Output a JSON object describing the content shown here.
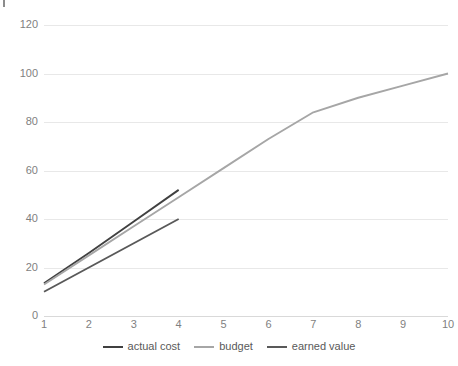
{
  "chart_data": {
    "type": "line",
    "title": "",
    "subtitle": "",
    "xlabel": "",
    "ylabel": "",
    "x": [
      1,
      2,
      3,
      4,
      5,
      6,
      7,
      8,
      9,
      10
    ],
    "xlim": [
      1,
      10
    ],
    "ylim": [
      0,
      120
    ],
    "y_ticks": [
      0,
      20,
      40,
      60,
      80,
      100,
      120
    ],
    "x_ticks": [
      1,
      2,
      3,
      4,
      5,
      6,
      7,
      8,
      9,
      10
    ],
    "x_tick_labels": [
      "1",
      "2",
      "3",
      "4",
      "5",
      "6",
      "7",
      "8",
      "9",
      "10"
    ],
    "y_tick_labels": [
      "0",
      "20",
      "40",
      "60",
      "80",
      "100",
      "120"
    ],
    "grid": true,
    "grid_axis": "y",
    "legend_position": "bottom",
    "background_color": "#ffffff",
    "gridline_color": "#e8e8e8",
    "tick_label_color": "#7f7f7f",
    "series": [
      {
        "name": "actual cost",
        "color": "#404040",
        "x": [
          1,
          2,
          3,
          4
        ],
        "values": [
          13.5,
          26,
          39,
          52
        ]
      },
      {
        "name": "budget",
        "color": "#a6a6a6",
        "x": [
          1,
          2,
          3,
          4,
          5,
          6,
          7,
          8,
          9,
          10
        ],
        "values": [
          13,
          25,
          37,
          49,
          61,
          73,
          84,
          90,
          95,
          100
        ]
      },
      {
        "name": "earned value",
        "color": "#595959",
        "x": [
          1,
          2,
          3,
          4
        ],
        "values": [
          10,
          20,
          30,
          40
        ]
      }
    ]
  },
  "legend": {
    "items": [
      {
        "label": "actual cost",
        "color": "#404040"
      },
      {
        "label": "budget",
        "color": "#a6a6a6"
      },
      {
        "label": "earned value",
        "color": "#595959"
      }
    ]
  }
}
